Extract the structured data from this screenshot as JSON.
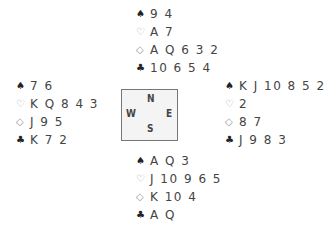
{
  "hands": {
    "north": {
      "spades": "9 4",
      "hearts": "A 7",
      "diamonds": "A Q 6 3 2",
      "clubs": "10 6 5 4"
    },
    "west": {
      "spades": "7 6",
      "hearts": "K Q 8 4 3",
      "diamonds": "J 9 5",
      "clubs": "K 7 2"
    },
    "east": {
      "spades": "K J 10 8 5 2",
      "hearts": "2",
      "diamonds": "8 7",
      "clubs": "J 9 8 3"
    },
    "south": {
      "spades": "A Q 3",
      "hearts": "J 10 9 6 5",
      "diamonds": "K 10 4",
      "clubs": "A Q"
    }
  },
  "suits": {
    "spades": "♠",
    "hearts": "♡",
    "diamonds": "◇",
    "clubs": "♣"
  },
  "compass": {
    "north": "N",
    "south": "S",
    "west": "W",
    "east": "E"
  }
}
